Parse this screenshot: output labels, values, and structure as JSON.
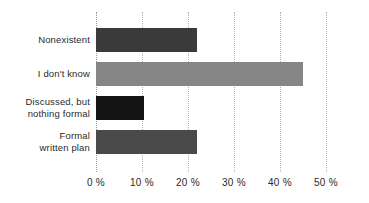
{
  "chart_data": {
    "type": "bar",
    "orientation": "horizontal",
    "title": "",
    "subtitle": "",
    "xlabel": "",
    "ylabel": "",
    "xlim": [
      0,
      50
    ],
    "xticks": [
      0,
      10,
      20,
      30,
      40,
      50
    ],
    "xtick_labels": [
      "0 %",
      "10 %",
      "20 %",
      "30 %",
      "40 %",
      "50 %"
    ],
    "grid": "vertical-dotted",
    "legend": "none",
    "categories": [
      "Nonexistent",
      "I don't know",
      "Discussed, but nothing formal",
      "Formal written plan"
    ],
    "values": [
      22,
      45,
      10.5,
      22
    ],
    "bar_colors": [
      "#3a3a3a",
      "#868686",
      "#141414",
      "#4a4a4a"
    ],
    "bars": [
      {
        "label_line1": "Nonexistent",
        "label_line2": "",
        "value": 22,
        "color": "#3a3a3a"
      },
      {
        "label_line1": "I don't know",
        "label_line2": "",
        "value": 45,
        "color": "#868686"
      },
      {
        "label_line1": "Discussed, but",
        "label_line2": "nothing formal",
        "value": 10.5,
        "color": "#141414"
      },
      {
        "label_line1": "Formal",
        "label_line2": "written plan",
        "value": 22,
        "color": "#4a4a4a"
      }
    ]
  },
  "axis": {
    "tick_0": "0 %",
    "tick_1": "10 %",
    "tick_2": "20 %",
    "tick_3": "30 %",
    "tick_4": "40 %",
    "tick_5": "50 %"
  },
  "labels": {
    "bar0_line1": "Nonexistent",
    "bar0_line2": "",
    "bar1_line1": "I don't know",
    "bar1_line2": "",
    "bar2_line1": "Discussed, but",
    "bar2_line2": "nothing formal",
    "bar3_line1": "Formal",
    "bar3_line2": "written plan"
  }
}
